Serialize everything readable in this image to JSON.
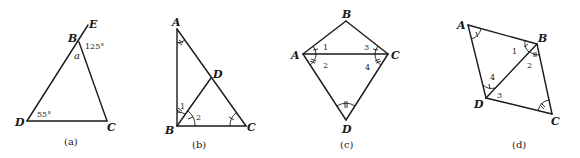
{
  "figures": [
    {
      "id": "a",
      "caption": "(a)",
      "vertices": {
        "B": "B",
        "C": "C",
        "D": "D",
        "E": "E"
      },
      "angle_labels": {
        "exterior_B": "125°",
        "interior_B": "a",
        "angle_D": "55°"
      }
    },
    {
      "id": "b",
      "caption": "(b)",
      "vertices": {
        "A": "A",
        "B": "B",
        "C": "C",
        "D": "D"
      },
      "angle_labels": {
        "angle1": "1",
        "angle2": "2"
      }
    },
    {
      "id": "c",
      "caption": "(c)",
      "vertices": {
        "A": "A",
        "B": "B",
        "C": "C",
        "D": "D"
      },
      "angle_labels": {
        "angle1": "1",
        "angle2": "2",
        "angle3": "3",
        "angle4": "4"
      }
    },
    {
      "id": "d",
      "caption": "(d)",
      "vertices": {
        "A": "A",
        "B": "B",
        "C": "C",
        "D": "D"
      },
      "angle_labels": {
        "angle1": "1",
        "angle2": "2",
        "angle3": "3",
        "angle4": "4"
      }
    }
  ]
}
